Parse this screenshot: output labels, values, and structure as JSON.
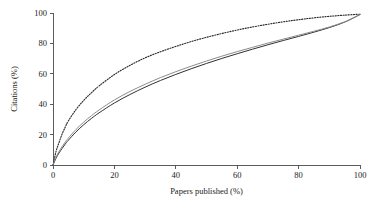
{
  "chart_data": {
    "type": "line",
    "title": "",
    "xlabel": "Papers published (%)",
    "ylabel": "Citations (%)",
    "xlim": [
      0,
      100
    ],
    "ylim": [
      0,
      100
    ],
    "xticks": [
      0,
      20,
      40,
      60,
      80,
      100
    ],
    "yticks": [
      0,
      20,
      40,
      60,
      80,
      100
    ],
    "xtick_labels": [
      "0",
      "20",
      "40",
      "60",
      "80",
      "100"
    ],
    "ytick_labels": [
      "0",
      "20",
      "40",
      "60",
      "80",
      "100"
    ],
    "grid": false,
    "legend": "none",
    "x": [
      0,
      1,
      2,
      3,
      4,
      5,
      7.5,
      10,
      12.5,
      15,
      20,
      25,
      30,
      35,
      40,
      45,
      50,
      55,
      60,
      65,
      70,
      75,
      80,
      85,
      90,
      95,
      100
    ],
    "series": [
      {
        "name": "dotted-curve",
        "style": "dotted",
        "color": "#2b2b2b",
        "values": [
          0,
          9,
          15,
          20.5,
          25,
          29,
          36.5,
          42.5,
          47.5,
          52,
          59.5,
          65.5,
          70.5,
          74.5,
          78,
          81.2,
          84,
          86.5,
          88.8,
          90.8,
          92.6,
          94.2,
          95.6,
          96.8,
          97.8,
          98.6,
          99.2
        ]
      },
      {
        "name": "solid-black-curve",
        "style": "solid",
        "color": "#303030",
        "values": [
          0,
          4.5,
          8.0,
          11.0,
          13.8,
          16.3,
          21.8,
          26.5,
          30.6,
          34.3,
          40.8,
          46.3,
          51.2,
          55.6,
          59.6,
          63.3,
          66.8,
          70.1,
          73.2,
          76.2,
          79.1,
          81.9,
          84.6,
          87.4,
          90.4,
          94.0,
          99.0
        ]
      },
      {
        "name": "solid-gray-curve",
        "style": "solid",
        "color": "#8c8c8c",
        "values": [
          0,
          5.2,
          9.0,
          12.2,
          15.1,
          17.7,
          23.4,
          28.2,
          32.4,
          36.2,
          42.8,
          48.3,
          53.1,
          57.5,
          61.4,
          65.0,
          68.4,
          71.6,
          74.6,
          77.4,
          80.2,
          82.8,
          85.4,
          88.0,
          90.8,
          94.2,
          99.0
        ]
      }
    ]
  },
  "geometry": {
    "plot_left": 53,
    "plot_right": 360,
    "plot_top": 13,
    "plot_bottom": 165
  }
}
